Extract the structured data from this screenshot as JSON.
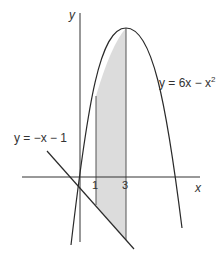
{
  "diagram": {
    "type": "function-graph",
    "axes": {
      "x_label": "x",
      "y_label": "y"
    },
    "ticks": [
      {
        "value": 1,
        "label": "1"
      },
      {
        "value": 3,
        "label": "3"
      }
    ],
    "curves": [
      {
        "name": "parabola",
        "equation": "y = 6x − x²",
        "label_main": "y = 6x − x",
        "label_sup": "2"
      },
      {
        "name": "line",
        "equation": "y = −x − 1",
        "label": "y = −x − 1"
      }
    ],
    "shaded_region": {
      "x_from": 1,
      "x_to": 3,
      "between": [
        "y = 6x − x²",
        "y = −x − 1"
      ],
      "fill": "#dcdcdc"
    },
    "colors": {
      "stroke": "#2a2a2a",
      "shade": "#dcdcdc",
      "background": "#ffffff"
    }
  }
}
